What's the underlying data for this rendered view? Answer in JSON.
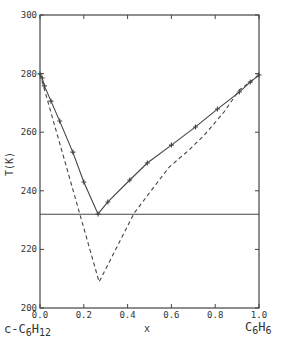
{
  "chart_data": {
    "type": "line",
    "title": "",
    "xlabel": "x",
    "ylabel": "T(K)",
    "xlim": [
      0.0,
      1.0
    ],
    "ylim": [
      200,
      300
    ],
    "x_ticks": [
      "0.0",
      "0.2",
      "0.4",
      "0.6",
      "0.8",
      "1.0"
    ],
    "y_ticks": [
      "200",
      "220",
      "240",
      "260",
      "280",
      "300"
    ],
    "grid": false,
    "legend": null,
    "component_labels": {
      "left": {
        "base": "c-C",
        "sub1": "6",
        "mid": "H",
        "sub2": "12"
      },
      "right": {
        "base": "C",
        "sub1": "6",
        "mid": "H",
        "sub2": "6"
      }
    },
    "series": [
      {
        "name": "liquidus (experimental, solid line with + markers)",
        "style": "solid",
        "markers": "+",
        "x": [
          0.0,
          0.01,
          0.02,
          0.05,
          0.09,
          0.15,
          0.2,
          0.265,
          0.31,
          0.41,
          0.49,
          0.6,
          0.71,
          0.81,
          0.91,
          0.96,
          1.0
        ],
        "y": [
          279.9,
          278.5,
          275.8,
          270.6,
          263.8,
          253.2,
          243.0,
          232.1,
          236.2,
          243.7,
          249.5,
          255.6,
          261.8,
          267.9,
          273.7,
          277.1,
          279.5
        ]
      },
      {
        "name": "ideal liquidus (dashed)",
        "style": "dashed",
        "x": [
          0.0,
          0.27,
          0.43,
          0.52,
          0.59,
          0.68,
          0.75,
          0.84,
          0.91,
          1.0
        ],
        "y": [
          279.9,
          208.9,
          232.4,
          241.3,
          248.1,
          253.9,
          259.0,
          266.9,
          274.4,
          279.5
        ]
      },
      {
        "name": "eutectic temperature (horizontal line)",
        "style": "solid",
        "x": [
          0.0,
          1.0
        ],
        "y": [
          232,
          232
        ]
      }
    ]
  }
}
